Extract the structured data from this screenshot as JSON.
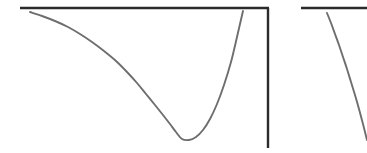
{
  "figure": {
    "width": 367,
    "height": 153,
    "background": "#ffffff",
    "caption": "",
    "watermark_line1": "",
    "watermark_line2": ""
  },
  "style": {
    "axis_color": "#2b2b2b",
    "axis_width": 2.4,
    "curve_color": "#6e6e6e",
    "curve_width": 1.9,
    "watermark_color": "#fcfcfc"
  },
  "chart_data": [
    {
      "type": "line",
      "name": "left-panel-potential-well",
      "title": "",
      "subtitle": "",
      "xlabel": "",
      "ylabel": "",
      "xlim": [
        20,
        270
      ],
      "ylim": [
        148,
        8
      ],
      "grid": false,
      "legend": null,
      "tick_labels_x": [],
      "tick_labels_y": [],
      "annotations": [],
      "axes": {
        "top_border": {
          "x1": 20,
          "y1": 8,
          "x2": 269,
          "y2": 8
        },
        "right_spine": {
          "x1": 268,
          "y1": 8,
          "x2": 268,
          "y2": 148
        }
      },
      "minimum_point": {
        "x": 182,
        "y": 140
      },
      "x": [
        30,
        42,
        55,
        68,
        80,
        92,
        104,
        116,
        127,
        137,
        146,
        155,
        163,
        170,
        176,
        182,
        189,
        196,
        203,
        210,
        217,
        224,
        231,
        237,
        243
      ],
      "y": [
        12,
        16,
        21,
        27,
        34,
        42,
        51,
        61,
        72,
        83,
        94,
        105,
        115,
        124,
        132,
        139,
        140,
        137,
        130,
        119,
        104,
        85,
        62,
        37,
        11
      ]
    },
    {
      "type": "line",
      "name": "right-panel-potential-curve",
      "title": "",
      "subtitle": "",
      "xlabel": "",
      "ylabel": "",
      "xlim": [
        301,
        367
      ],
      "ylim": [
        153,
        8
      ],
      "grid": false,
      "legend": null,
      "tick_labels_x": [],
      "tick_labels_y": [],
      "annotations": [],
      "axes": {
        "top_border": {
          "x1": 301,
          "y1": 8,
          "x2": 367,
          "y2": 8
        },
        "right_spine": null
      },
      "minimum_point": null,
      "x": [
        327,
        331,
        335,
        339,
        343,
        347,
        351,
        355,
        359,
        363,
        367
      ],
      "y": [
        13,
        23,
        34,
        45,
        57,
        69,
        82,
        95,
        109,
        124,
        140
      ]
    }
  ]
}
